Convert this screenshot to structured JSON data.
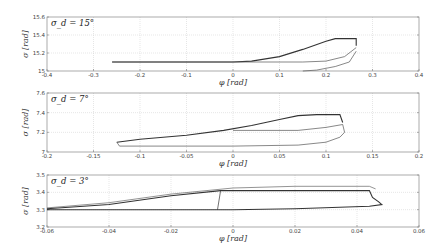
{
  "chart_data": [
    {
      "type": "line",
      "annotation": "σ_d = 15°",
      "xlabel": "φ [rad]",
      "ylabel": "σ [rad]",
      "xlim": [
        -0.4,
        0.4
      ],
      "ylim": [
        15,
        15.6
      ],
      "xticks": [
        "-0.4",
        "-0.3",
        "-0.2",
        "-0.1",
        "0",
        "0.1",
        "0.2",
        "0.3",
        "0.4"
      ],
      "yticks": [
        "15",
        "15.2",
        "15.4",
        "15.6"
      ],
      "grid": true,
      "series": [
        {
          "name": "upper",
          "color": "#333333",
          "points": [
            [
              -0.26,
              15.1
            ],
            [
              0,
              15.1
            ],
            [
              0.04,
              15.11
            ],
            [
              0.1,
              15.16
            ],
            [
              0.15,
              15.24
            ],
            [
              0.2,
              15.33
            ],
            [
              0.22,
              15.36
            ],
            [
              0.265,
              15.36
            ],
            [
              0.265,
              15.28
            ]
          ]
        },
        {
          "name": "middle",
          "color": "#555555",
          "points": [
            [
              -0.26,
              15.1
            ],
            [
              0.15,
              15.1
            ],
            [
              0.2,
              15.11
            ],
            [
              0.24,
              15.16
            ],
            [
              0.265,
              15.26
            ]
          ]
        },
        {
          "name": "lower",
          "color": "#555555",
          "points": [
            [
              0.15,
              15.0
            ],
            [
              0.18,
              15.01
            ],
            [
              0.22,
              15.05
            ],
            [
              0.25,
              15.1
            ],
            [
              0.265,
              15.22
            ]
          ]
        }
      ]
    },
    {
      "type": "line",
      "annotation": "σ_d = 7°",
      "xlabel": "φ [rad]",
      "ylabel": "σ [rad]",
      "xlim": [
        -0.2,
        0.2
      ],
      "ylim": [
        7,
        7.6
      ],
      "xticks": [
        "-0.2",
        "-0.15",
        "-0.1",
        "-0.05",
        "0",
        "0.05",
        "0.1",
        "0.15",
        "0.2"
      ],
      "yticks": [
        "7",
        "7.2",
        "7.4",
        "7.6"
      ],
      "grid": true,
      "series": [
        {
          "name": "upper",
          "color": "#333333",
          "points": [
            [
              -0.125,
              7.1
            ],
            [
              -0.1,
              7.13
            ],
            [
              -0.05,
              7.17
            ],
            [
              -0.01,
              7.22
            ],
            [
              0.02,
              7.27
            ],
            [
              0.05,
              7.33
            ],
            [
              0.07,
              7.37
            ],
            [
              0.09,
              7.38
            ],
            [
              0.115,
              7.38
            ],
            [
              0.118,
              7.3
            ]
          ]
        },
        {
          "name": "inner",
          "color": "#555555",
          "points": [
            [
              0,
              7.22
            ],
            [
              0.07,
              7.22
            ],
            [
              0.1,
              7.25
            ],
            [
              0.118,
              7.28
            ]
          ]
        },
        {
          "name": "lower",
          "color": "#555555",
          "points": [
            [
              -0.125,
              7.1
            ],
            [
              -0.122,
              7.06
            ],
            [
              0,
              7.06
            ],
            [
              0.07,
              7.07
            ],
            [
              0.1,
              7.1
            ],
            [
              0.115,
              7.15
            ],
            [
              0.12,
              7.2
            ],
            [
              0.118,
              7.28
            ]
          ]
        }
      ]
    },
    {
      "type": "line",
      "annotation": "σ_d = 3°",
      "xlabel": "φ [rad]",
      "ylabel": "σ [rad]",
      "xlim": [
        -0.06,
        0.06
      ],
      "ylim": [
        3.2,
        3.5
      ],
      "xticks": [
        "-0.06",
        "-0.04",
        "-0.02",
        "0",
        "0.02",
        "0.04",
        "0.06"
      ],
      "yticks": [
        "3.2",
        "3.3",
        "3.4",
        "3.5"
      ],
      "grid": true,
      "series": [
        {
          "name": "top",
          "color": "#666666",
          "points": [
            [
              -0.06,
              3.31
            ],
            [
              -0.04,
              3.34
            ],
            [
              -0.02,
              3.39
            ],
            [
              0,
              3.425
            ],
            [
              0.02,
              3.435
            ],
            [
              0.044,
              3.435
            ],
            [
              0.046,
              3.42
            ]
          ]
        },
        {
          "name": "upper",
          "color": "#333333",
          "points": [
            [
              -0.06,
              3.305
            ],
            [
              -0.04,
              3.33
            ],
            [
              -0.02,
              3.38
            ],
            [
              -0.004,
              3.41
            ],
            [
              0.02,
              3.41
            ],
            [
              0.044,
              3.41
            ],
            [
              0.045,
              3.37
            ],
            [
              0.047,
              3.345
            ],
            [
              0.048,
              3.33
            ],
            [
              0.044,
              3.32
            ],
            [
              0.02,
              3.305
            ],
            [
              0,
              3.3
            ],
            [
              -0.06,
              3.3
            ]
          ]
        },
        {
          "name": "connector",
          "color": "#333333",
          "points": [
            [
              -0.005,
              3.3
            ],
            [
              -0.004,
              3.41
            ]
          ]
        }
      ]
    }
  ]
}
